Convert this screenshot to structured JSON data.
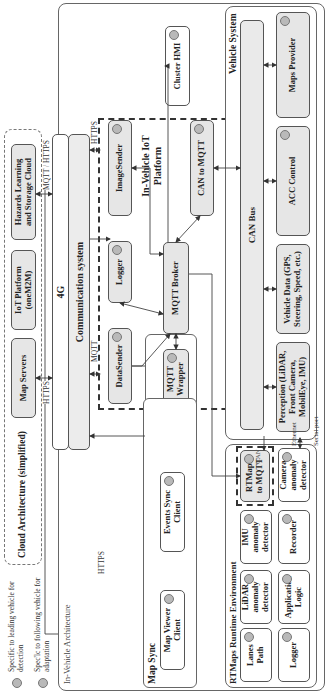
{
  "legend": [
    {
      "label": "Specific to leading vehicle for detection"
    },
    {
      "label": "Spec'lc to following vehicle for adaptation"
    }
  ],
  "cloud": {
    "title": "Cloud Architecture (simplified)",
    "items": [
      {
        "label": "Map Servers"
      },
      {
        "label": "IoT Platform (oneM2M)"
      },
      {
        "label": "Hazards Learning and Storage Cloud"
      }
    ]
  },
  "in_vehicle": {
    "title": "In-Vehicle Architecture",
    "fourg": "4G",
    "comm": "Communication system",
    "iot_platform": {
      "title": "In-Vehicle IoT Platform",
      "items": {
        "datasender": "DataSender",
        "logger": "Logger",
        "imagesender": "ImageSender",
        "mqtt_wrapper": "MQTT Wrapper",
        "mqtt_broker": "MQTT Broker",
        "can_to_mqtt": "CAN to MQTT"
      }
    },
    "cluster_hmi": "Cluster HMI",
    "map_sync": {
      "title": "Map Sync",
      "map_viewer": "Map Viewer Client",
      "events_sync": "Events Sync Client"
    },
    "vehicle_system": {
      "title": "Vehicle System",
      "can_bus": "CAN Bus",
      "perception": "Perception (LiDAR, Front Camera, MobilEye, IMU)",
      "vehicle_data": "Vehicle Data (GPS, Steering, Speed, etc.)",
      "acc": "ACC Control",
      "maps_provider": "Maps Provider"
    },
    "rtmaps": {
      "title": "RTMaps Runtime Environment",
      "lanes_path": "Lanes Path",
      "logger": "Logger",
      "lidar": "LiDAR anomaly detector",
      "app_logic": "Application Logic",
      "imu": "IMU anomaly detector",
      "recorder": "Recorder",
      "rtmaps_to_mqtt": "RTMaps to MQTT",
      "camera": "Camera anomaly detector"
    }
  },
  "links": {
    "https_map": "HTTPS",
    "mqtt_https": "MQTT / HTTPS",
    "https_iot": "HTTPS",
    "mqtt_iot": "MQTT",
    "https_sync": "HTTPS",
    "can": "CAN",
    "ethernet": "Ethernet",
    "serial": "Serial port"
  }
}
